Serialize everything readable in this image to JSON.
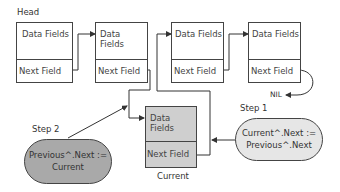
{
  "diagram": {
    "head_label": "Head",
    "nodes": [
      {
        "data_label": "Data Fields",
        "next_label": "Next Field"
      },
      {
        "data_label": "Data Fields",
        "next_label": "Next Field"
      },
      {
        "data_label": "Data Fields",
        "next_label": "Next Field"
      },
      {
        "data_label": "Data Fields",
        "next_label": "Next Field"
      }
    ],
    "nil_label": "NIL",
    "current_node": {
      "data_label": "Data Fields",
      "next_label": "Next Field",
      "caption": "Current",
      "fill": "#cfcfcf"
    },
    "step1": {
      "label": "Step 1",
      "line1": "Current^.Next :=",
      "line2": "Previous^.Next",
      "fill": "#e6e6e6"
    },
    "step2": {
      "label": "Step 2",
      "line1": "Previous^.Next :=",
      "line2": "Current",
      "fill": "#a9a9a9"
    },
    "colors": {
      "line": "#333333",
      "border": "#444444"
    }
  }
}
